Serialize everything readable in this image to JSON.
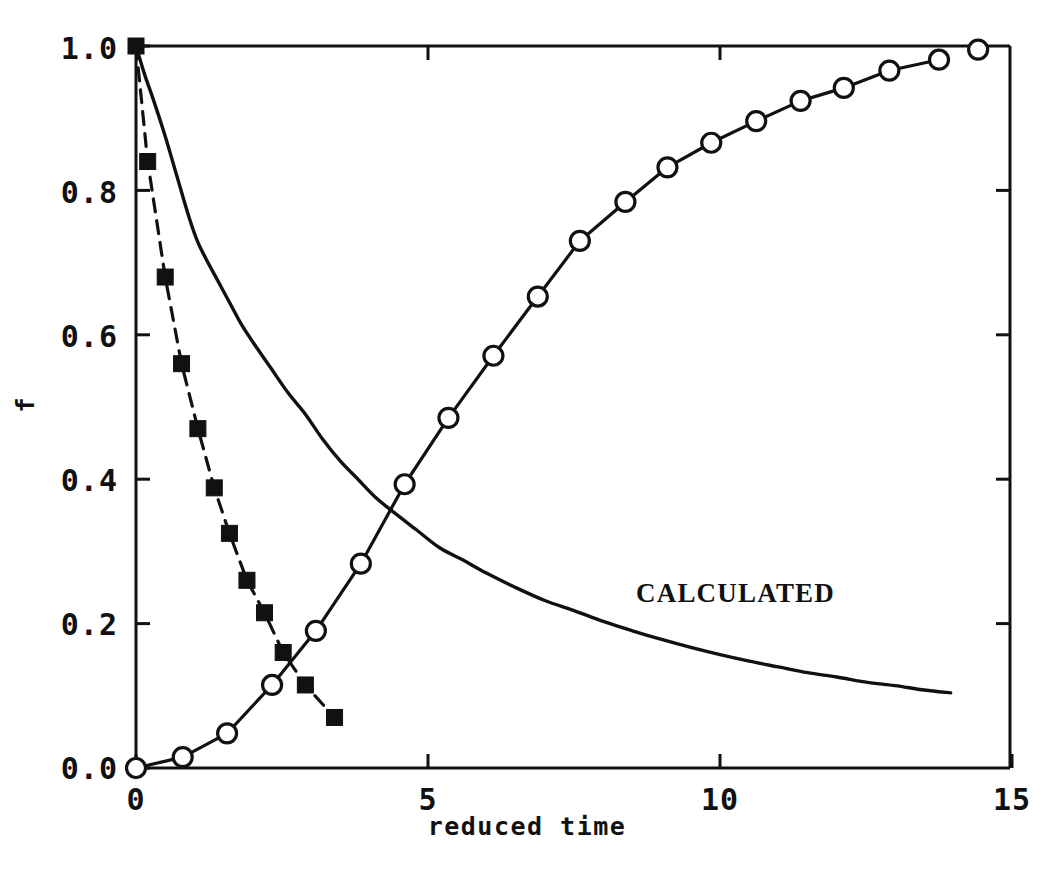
{
  "chart_data": {
    "type": "line",
    "title": "",
    "xlabel": "reduced time",
    "ylabel": "f",
    "xlim": [
      0,
      15
    ],
    "ylim": [
      0.0,
      1.0
    ],
    "grid": false,
    "legend_position": "none",
    "xticks": [
      0,
      5,
      10,
      15
    ],
    "xtick_labels": [
      "0",
      "5",
      "10",
      "15"
    ],
    "yticks": [
      0.0,
      0.2,
      0.4,
      0.6,
      0.8,
      1.0
    ],
    "ytick_labels": [
      "0.0",
      "0.2",
      "0.4",
      "0.6",
      "0.8",
      "1.0"
    ],
    "annotations": [
      {
        "text": "CALCULATED",
        "x": 8.55,
        "y": 0.235
      }
    ],
    "series": [
      {
        "name": "calculated-decay-curve",
        "marker": "none",
        "line": "solid",
        "color": "#111111",
        "points": [
          [
            0.0,
            1.0
          ],
          [
            0.15,
            0.96
          ],
          [
            0.3,
            0.925
          ],
          [
            0.5,
            0.875
          ],
          [
            0.7,
            0.82
          ],
          [
            0.9,
            0.765
          ],
          [
            1.05,
            0.73
          ],
          [
            1.2,
            0.705
          ],
          [
            1.4,
            0.675
          ],
          [
            1.6,
            0.645
          ],
          [
            1.8,
            0.615
          ],
          [
            2.0,
            0.59
          ],
          [
            2.3,
            0.555
          ],
          [
            2.6,
            0.52
          ],
          [
            2.9,
            0.49
          ],
          [
            3.2,
            0.455
          ],
          [
            3.5,
            0.425
          ],
          [
            3.8,
            0.4
          ],
          [
            4.1,
            0.375
          ],
          [
            4.4,
            0.355
          ],
          [
            4.8,
            0.33
          ],
          [
            5.2,
            0.305
          ],
          [
            5.6,
            0.288
          ],
          [
            6.0,
            0.27
          ],
          [
            6.5,
            0.25
          ],
          [
            7.0,
            0.232
          ],
          [
            7.5,
            0.218
          ],
          [
            8.0,
            0.203
          ],
          [
            8.5,
            0.19
          ],
          [
            9.0,
            0.178
          ],
          [
            9.5,
            0.167
          ],
          [
            10.0,
            0.157
          ],
          [
            10.5,
            0.148
          ],
          [
            11.0,
            0.14
          ],
          [
            11.5,
            0.132
          ],
          [
            12.0,
            0.126
          ],
          [
            12.5,
            0.119
          ],
          [
            13.0,
            0.114
          ],
          [
            13.5,
            0.108
          ],
          [
            13.95,
            0.104
          ]
        ]
      },
      {
        "name": "decreasing-square-series",
        "marker": "filled-square",
        "line": "dashed",
        "color": "#111111",
        "points": [
          [
            0.0,
            1.0
          ],
          [
            0.2,
            0.84
          ],
          [
            0.5,
            0.68
          ],
          [
            0.78,
            0.56
          ],
          [
            1.06,
            0.47
          ],
          [
            1.34,
            0.388
          ],
          [
            1.6,
            0.325
          ],
          [
            1.9,
            0.26
          ],
          [
            2.2,
            0.215
          ],
          [
            2.52,
            0.16
          ],
          [
            2.9,
            0.115
          ],
          [
            3.4,
            0.07
          ]
        ]
      },
      {
        "name": "increasing-circle-series",
        "marker": "open-circle",
        "line": "solid",
        "color": "#111111",
        "points": [
          [
            0.0,
            0.0
          ],
          [
            0.8,
            0.015
          ],
          [
            1.56,
            0.048
          ],
          [
            2.33,
            0.115
          ],
          [
            3.08,
            0.19
          ],
          [
            3.85,
            0.283
          ],
          [
            4.6,
            0.393
          ],
          [
            5.35,
            0.485
          ],
          [
            6.12,
            0.571
          ],
          [
            6.88,
            0.653
          ],
          [
            7.6,
            0.73
          ],
          [
            8.38,
            0.784
          ],
          [
            9.1,
            0.832
          ],
          [
            9.85,
            0.866
          ],
          [
            10.62,
            0.896
          ],
          [
            11.38,
            0.924
          ],
          [
            12.12,
            0.942
          ],
          [
            12.9,
            0.966
          ],
          [
            13.75,
            0.981
          ],
          [
            14.42,
            0.995
          ]
        ],
        "line_points": [
          [
            0.0,
            0.0
          ],
          [
            0.8,
            0.015
          ],
          [
            1.56,
            0.048
          ],
          [
            2.33,
            0.115
          ],
          [
            3.08,
            0.19
          ],
          [
            3.85,
            0.283
          ],
          [
            4.6,
            0.393
          ],
          [
            5.35,
            0.485
          ],
          [
            6.12,
            0.571
          ],
          [
            6.88,
            0.653
          ],
          [
            7.6,
            0.73
          ],
          [
            8.38,
            0.784
          ],
          [
            9.1,
            0.832
          ],
          [
            9.85,
            0.866
          ],
          [
            10.62,
            0.896
          ],
          [
            11.38,
            0.924
          ],
          [
            12.12,
            0.942
          ],
          [
            12.9,
            0.966
          ],
          [
            13.75,
            0.981
          ]
        ]
      }
    ]
  },
  "axes": {
    "frame_color": "#111111",
    "x_axis_title": "reduced time",
    "y_axis_title": "f"
  }
}
